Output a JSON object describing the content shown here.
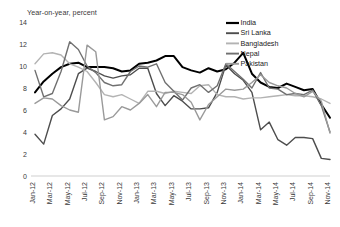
{
  "chart_data": {
    "type": "line",
    "title": "Year-on-year, percent",
    "xlabel": "",
    "ylabel": "",
    "ylim": [
      0,
      14
    ],
    "yticks": [
      0,
      2,
      4,
      6,
      8,
      10,
      12,
      14
    ],
    "grid": false,
    "legend_position": "top-right",
    "x": [
      "Jan-12",
      "Feb-12",
      "Mar-12",
      "Apr-12",
      "May-12",
      "Jun-12",
      "Jul-12",
      "Aug-12",
      "Sep-12",
      "Oct-12",
      "Nov-12",
      "Dec-12",
      "Jan-13",
      "Feb-13",
      "Mar-13",
      "Apr-13",
      "May-13",
      "Jun-13",
      "Jul-13",
      "Aug-13",
      "Sep-13",
      "Oct-13",
      "Nov-13",
      "Dec-13",
      "Jan-14",
      "Feb-14",
      "Mar-14",
      "Apr-14",
      "May-14",
      "Jun-14",
      "Jul-14",
      "Aug-14",
      "Sep-14",
      "Oct-14",
      "Nov-14"
    ],
    "xtick_labels": [
      "Jan-12",
      "Mar-12",
      "May-12",
      "Jul-12",
      "Sep-12",
      "Nov-12",
      "Jan-13",
      "Mar-13",
      "May-13",
      "Jul-13",
      "Sep-13",
      "Nov-13",
      "Jan-14",
      "Mar-14",
      "May-14",
      "Jul-14",
      "Sep-14",
      "Nov-14"
    ],
    "series": [
      {
        "name": "India",
        "color": "#000000",
        "width": 2.0,
        "values": [
          7.6,
          8.6,
          9.3,
          9.9,
          10.2,
          10.3,
          9.9,
          9.9,
          9.9,
          9.8,
          9.5,
          9.6,
          10.2,
          10.3,
          10.5,
          10.9,
          10.9,
          9.9,
          9.6,
          9.4,
          9.8,
          9.5,
          9.7,
          10.3,
          11.2,
          9.3,
          8.5,
          8.1,
          8.0,
          8.4,
          8.1,
          7.8,
          7.9,
          6.5,
          5.3
        ]
      },
      {
        "name": "Sri Lanka",
        "color": "#4d4d4d",
        "width": 1.4,
        "values": [
          3.8,
          2.9,
          5.5,
          6.1,
          7.0,
          9.3,
          9.8,
          9.5,
          9.1,
          8.9,
          9.1,
          9.2,
          9.8,
          9.8,
          7.5,
          6.4,
          7.3,
          6.8,
          6.1,
          6.1,
          6.2,
          7.6,
          10.1,
          9.3,
          8.7,
          7.6,
          4.2,
          4.9,
          3.3,
          2.8,
          3.5,
          3.5,
          3.4,
          1.6,
          1.5
        ]
      },
      {
        "name": "Bangladesh",
        "color": "#b3b3b3",
        "width": 1.4,
        "values": [
          10.2,
          11.1,
          11.2,
          11.0,
          10.2,
          9.9,
          9.5,
          8.5,
          7.4,
          7.2,
          7.4,
          7.0,
          6.6,
          7.7,
          7.7,
          7.5,
          7.7,
          7.6,
          7.5,
          8.2,
          8.3,
          7.4,
          7.2,
          7.2,
          7.0,
          7.1,
          7.1,
          7.2,
          7.3,
          7.4,
          7.3,
          7.3,
          7.2,
          7.0,
          6.6
        ]
      },
      {
        "name": "Nepal",
        "color": "#707070",
        "width": 1.4,
        "values": [
          9.6,
          7.2,
          7.5,
          9.5,
          12.2,
          11.5,
          10.0,
          9.4,
          8.5,
          8.2,
          8.3,
          9.5,
          10.0,
          9.9,
          10.2,
          8.5,
          7.7,
          6.9,
          8.0,
          8.3,
          7.6,
          8.2,
          10.2,
          9.5,
          8.8,
          8.0,
          9.4,
          8.0,
          7.9,
          7.4,
          7.5,
          7.4,
          7.8,
          6.4,
          4.0
        ]
      },
      {
        "name": "Pakistan",
        "color": "#9a9a9a",
        "width": 1.4,
        "values": [
          6.6,
          7.1,
          7.0,
          6.4,
          6.0,
          5.8,
          11.9,
          11.3,
          5.1,
          5.4,
          6.3,
          6.0,
          6.6,
          7.4,
          6.3,
          7.6,
          7.6,
          7.4,
          6.7,
          5.1,
          6.5,
          7.2,
          7.9,
          7.8,
          7.9,
          8.5,
          9.2,
          8.5,
          8.2,
          8.0,
          7.5,
          7.2,
          7.7,
          6.8,
          3.9
        ]
      }
    ]
  }
}
